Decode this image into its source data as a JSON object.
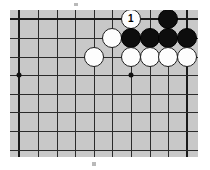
{
  "diagram": {
    "kind": "go-board-problem-diagram",
    "board": {
      "background_color": "#c8c8c8",
      "line_color": "#2b2b2b",
      "edge_line_color": "#1a1a1a",
      "columns": 10,
      "rows": 8,
      "cell_px": 18.6,
      "origin_x_px": 10,
      "origin_y_px": 10,
      "width_px": 188,
      "height_px": 147,
      "edges_shown": [
        "top",
        "left",
        "right"
      ],
      "star_points": [
        {
          "col": 0,
          "row": 3
        },
        {
          "col": 6,
          "row": 3
        }
      ]
    },
    "stones": [
      {
        "color": "white",
        "col": 6,
        "row": 0,
        "label": "1",
        "marked": true
      },
      {
        "color": "black",
        "col": 8,
        "row": 0,
        "label": "",
        "marked": false
      },
      {
        "color": "white",
        "col": 5,
        "row": 1,
        "label": "",
        "marked": false
      },
      {
        "color": "black",
        "col": 6,
        "row": 1,
        "label": "",
        "marked": false
      },
      {
        "color": "black",
        "col": 7,
        "row": 1,
        "label": "",
        "marked": false
      },
      {
        "color": "black",
        "col": 8,
        "row": 1,
        "label": "",
        "marked": false
      },
      {
        "color": "black",
        "col": 9,
        "row": 1,
        "label": "",
        "marked": false
      },
      {
        "color": "white",
        "col": 4,
        "row": 2,
        "label": "",
        "marked": false
      },
      {
        "color": "white",
        "col": 6,
        "row": 2,
        "label": "",
        "marked": false
      },
      {
        "color": "white",
        "col": 7,
        "row": 2,
        "label": "",
        "marked": false
      },
      {
        "color": "white",
        "col": 8,
        "row": 2,
        "label": "",
        "marked": false
      },
      {
        "color": "white",
        "col": 9,
        "row": 2,
        "label": "",
        "marked": false
      }
    ],
    "specks": [
      {
        "x_px": 74,
        "y_px": 3,
        "w_px": 4,
        "h_px": 3
      },
      {
        "x_px": 92,
        "y_px": 162,
        "w_px": 4,
        "h_px": 4
      }
    ],
    "colors": {
      "page_background": "#ffffff",
      "black_stone": "#0d0d0d",
      "white_stone": "#fdfdfd",
      "stone_outline": "#1d1d1d",
      "label_on_white": "#000000",
      "hoshi": "#111111"
    }
  }
}
